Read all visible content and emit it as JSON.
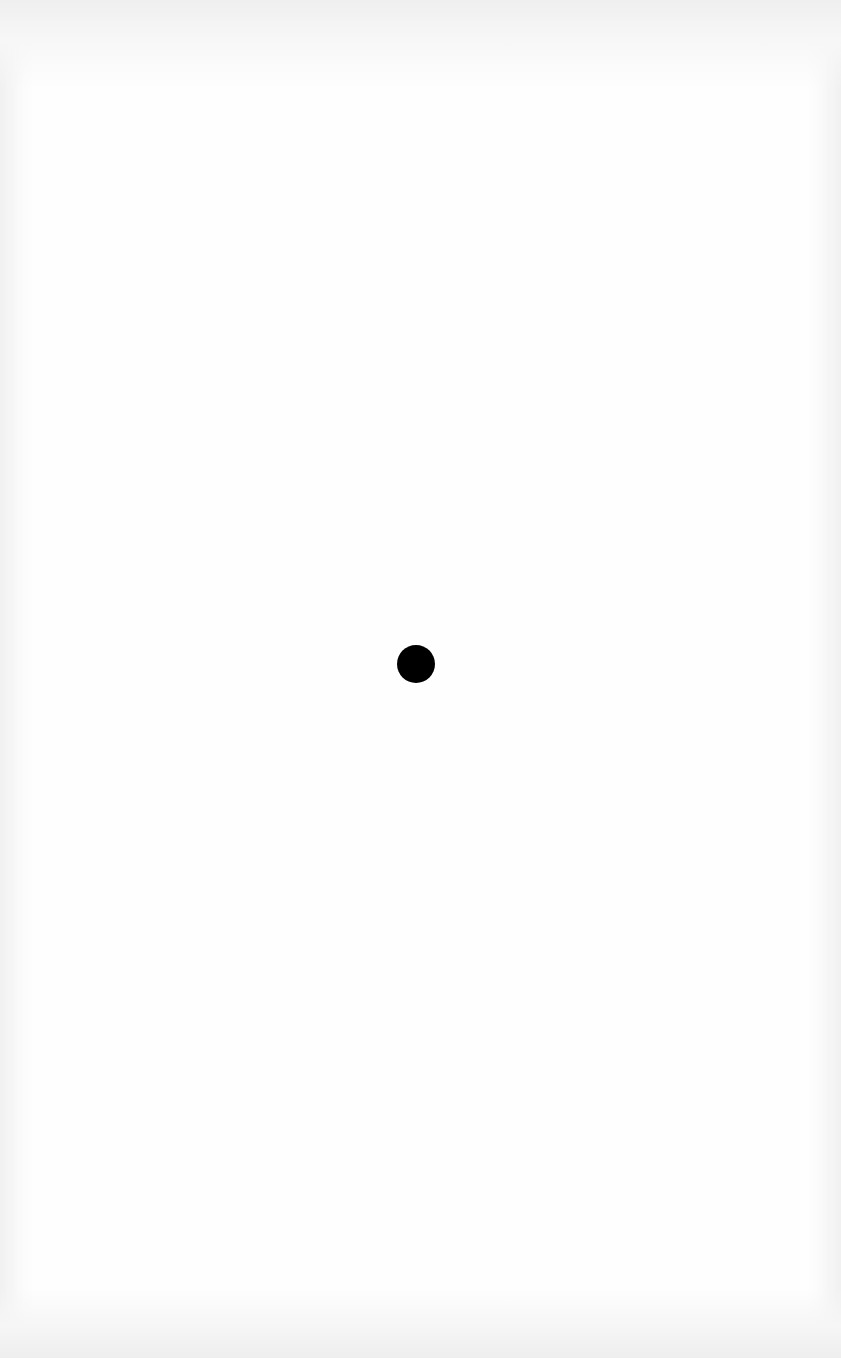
{
  "page": {
    "background_color": "#ffffff",
    "edge_shade_color": "#ececec"
  },
  "dot": {
    "shape": "circle",
    "color": "#000000",
    "center_x": 416,
    "center_y": 664,
    "diameter": 38
  }
}
